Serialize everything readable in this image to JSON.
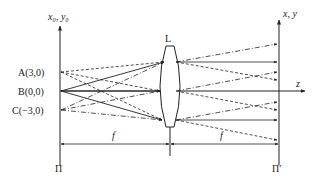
{
  "figure": {
    "type": "optical-system-diagram",
    "colors": {
      "stroke": "#222222",
      "background": "#ffffff"
    }
  },
  "labels": {
    "object_plane_axis": "x₀, y₀",
    "image_plane_axis": "x, y",
    "optical_axis": "z",
    "lens": "L",
    "object_plane": "Π",
    "image_plane": "Π′",
    "focal_left": "f",
    "focal_right": "f",
    "point_a": "A(3,0)",
    "point_b": "B(0,0)",
    "point_c": "C(−3,0)"
  },
  "points": [
    {
      "name": "A",
      "coords": "(3,0)",
      "line_style": "dashed"
    },
    {
      "name": "B",
      "coords": "(0,0)",
      "line_style": "solid"
    },
    {
      "name": "C",
      "coords": "(−3,0)",
      "line_style": "dash-dot"
    }
  ]
}
